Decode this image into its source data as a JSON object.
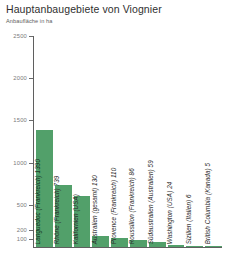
{
  "header": {
    "title": "Hauptanbaugebiete von Viognier",
    "subtitle": "Anbaufläche in ha"
  },
  "chart_data": {
    "type": "bar",
    "title": "Hauptanbaugebiete von Viognier",
    "subtitle": "Anbaufläche in ha",
    "xlabel": "",
    "ylabel": "Anbaufläche in ha",
    "ylim": [
      0,
      2500
    ],
    "grid": false,
    "legend": "none",
    "bar_color": "#52a06a",
    "axis_color": "#5f5f5f",
    "tick_label_color": "#7a7a7a",
    "yticks": [
      2500,
      2000,
      1500,
      1000,
      500,
      200,
      100
    ],
    "ytick_labels": [
      "2500",
      "2000",
      "1500",
      "1000",
      "500",
      "200",
      "100"
    ],
    "categories": [
      "Languedoc (Frankreich)",
      "Rhône (Frankreich)",
      "Kalifornien (USA)",
      "Australien (gesamt)",
      "Provence (Frankreich)",
      "Roussillon (Frankreich)",
      "Südaustralien (Australien)",
      "Washington (USA)",
      "Sizilien (Italien)",
      "British Columbia (Kanada)"
    ],
    "values": [
      1390,
      739,
      600,
      130,
      110,
      86,
      59,
      24,
      6,
      5
    ],
    "bar_labels": [
      "Languedoc (Frankreich) 1390",
      "Rhône (Frankreich) 739",
      "Kalifornien (USA)",
      "Australien (gesamt) 130",
      "Provence (Frankreich) 110",
      "Roussillon (Frankreich) 86",
      "Südaustralien (Australien) 59",
      "Washington (USA) 24",
      "Sizilien (Italien) 6",
      "British Columbia (Kanada) 5"
    ]
  }
}
